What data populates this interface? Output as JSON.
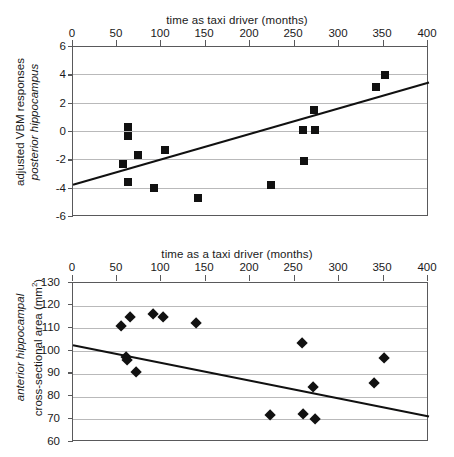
{
  "figure": {
    "background": "#ffffff",
    "marker_color": "#111111",
    "axis_color": "#59595b",
    "grid_color": "#b9b9ba",
    "width": 454,
    "height": 457
  },
  "chart_data": [
    {
      "id": "posterior-hippocampus-vbm",
      "type": "scatter",
      "title": "",
      "xlabel": "time as taxi driver (months)",
      "ylabel_line1": "adjusted VBM responses",
      "ylabel_line2": "posterior hippocampus",
      "ylabel_line2_style": "italic",
      "xlim": [
        0,
        400
      ],
      "ylim": [
        -6,
        6
      ],
      "xticks": [
        0,
        50,
        100,
        150,
        200,
        250,
        300,
        350,
        400
      ],
      "xticklabels": [
        "0",
        "50",
        "100",
        "150",
        "200",
        "250",
        "300",
        "350",
        "400"
      ],
      "yticks": [
        -6,
        -4,
        -2,
        0,
        2,
        4,
        6
      ],
      "yticklabels": [
        "-6",
        "-4",
        "-2",
        "0",
        "2",
        "4",
        "6"
      ],
      "grid": "horizontal",
      "legend": "none",
      "xaxis_position": "top",
      "marker": "square",
      "points": [
        {
          "x": 56,
          "y": -2.25
        },
        {
          "x": 62,
          "y": 0.35
        },
        {
          "x": 62,
          "y": -0.3
        },
        {
          "x": 62,
          "y": -3.5
        },
        {
          "x": 73,
          "y": -1.6
        },
        {
          "x": 91,
          "y": -3.95
        },
        {
          "x": 103,
          "y": -1.25
        },
        {
          "x": 140,
          "y": -4.65
        },
        {
          "x": 222,
          "y": -3.75
        },
        {
          "x": 258,
          "y": 0.15
        },
        {
          "x": 259,
          "y": -2.05
        },
        {
          "x": 271,
          "y": 1.55
        },
        {
          "x": 272,
          "y": 0.15
        },
        {
          "x": 340,
          "y": 3.2
        },
        {
          "x": 350,
          "y": 4.05
        }
      ],
      "trendline": {
        "x0": 0,
        "y0": -3.72,
        "x1": 400,
        "y1": 3.5,
        "direction": "positive"
      }
    },
    {
      "id": "anterior-hippocampal-area",
      "type": "scatter",
      "title": "",
      "xlabel": "time as a taxi driver (months)",
      "ylabel_line1": "anterior hippocampal",
      "ylabel_line1_style": "italic",
      "ylabel_line2": "cross-sectional area (mm2)",
      "ylabel_line2_display": "cross-sectional area (mm²)",
      "xlim": [
        0,
        400
      ],
      "ylim": [
        60,
        130
      ],
      "xticks": [
        0,
        50,
        100,
        150,
        200,
        250,
        300,
        350,
        400
      ],
      "xticklabels": [
        "0",
        "50",
        "100",
        "150",
        "200",
        "250",
        "300",
        "350",
        "400"
      ],
      "yticks": [
        60,
        70,
        80,
        90,
        100,
        110,
        120,
        130
      ],
      "yticklabels": [
        "60",
        "70",
        "80",
        "90",
        "100",
        "110",
        "120",
        "130"
      ],
      "grid": "horizontal",
      "legend": "none",
      "xaxis_position": "top",
      "marker": "diamond",
      "points": [
        {
          "x": 54,
          "y": 111.2
        },
        {
          "x": 60,
          "y": 97.5
        },
        {
          "x": 61,
          "y": 96.2
        },
        {
          "x": 64,
          "y": 115.2
        },
        {
          "x": 71,
          "y": 90.7
        },
        {
          "x": 90,
          "y": 116.4
        },
        {
          "x": 101,
          "y": 114.8
        },
        {
          "x": 138,
          "y": 112.3
        },
        {
          "x": 222,
          "y": 71.8
        },
        {
          "x": 257,
          "y": 103.6
        },
        {
          "x": 258,
          "y": 72.4
        },
        {
          "x": 270,
          "y": 84.0
        },
        {
          "x": 272,
          "y": 70.3
        },
        {
          "x": 338,
          "y": 85.9
        },
        {
          "x": 350,
          "y": 96.8
        }
      ],
      "trendline": {
        "x0": 0,
        "y0": 102.6,
        "x1": 400,
        "y1": 71.2,
        "direction": "negative"
      }
    }
  ]
}
